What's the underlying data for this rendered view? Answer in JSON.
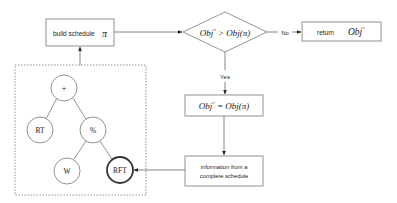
{
  "flowchart": {
    "build_box": {
      "label": "build schedule",
      "symbol": "π"
    },
    "decision": {
      "left": "Obj",
      "sup": "*",
      "op": " > ",
      "right": "Obj(π)"
    },
    "no_label": "No",
    "yes_label": "Yes",
    "return_box": {
      "label": "return",
      "value": "Obj",
      "sup": "*"
    },
    "assign_box": {
      "left": "Obj",
      "sup": "*",
      "op": " = ",
      "right": "Obj(π)"
    },
    "info_box": {
      "line1": "information from a",
      "line2": "complete schedule"
    }
  },
  "tree": {
    "nodes": {
      "root": "+",
      "left": "RT",
      "right": "%",
      "right_left": "W",
      "right_right": "RFT"
    }
  },
  "colors": {
    "stroke": "#666666",
    "text": "#222222"
  }
}
